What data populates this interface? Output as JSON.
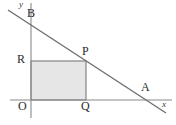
{
  "figure": {
    "background_color": "#ffffff",
    "line_color": "#6f6f6f",
    "axis_color": "#8a8a8a",
    "rect_fill_color": "#e6e6e6",
    "rect_stroke_color": "#7a7a7a",
    "label_color": "#2a2a2a"
  },
  "axes": {
    "x_axis": {
      "name": "x-axis",
      "label": "x",
      "start_px": [
        10,
        100
      ],
      "end_px": [
        172,
        100
      ]
    },
    "y_axis": {
      "name": "y-axis",
      "label": "y",
      "start_px": [
        31,
        118
      ],
      "end_px": [
        31,
        3
      ]
    },
    "origin_label": "O",
    "origin_px": [
      31,
      100
    ]
  },
  "line": {
    "name": "line-AB",
    "description": "straight line descending from upper-left through B and P to A on the x-axis",
    "start_px": [
      8,
      10
    ],
    "end_px": [
      166,
      113
    ],
    "passes_through": [
      "B",
      "P",
      "A"
    ]
  },
  "points": [
    {
      "id": "B",
      "label": "B",
      "px": [
        31,
        25
      ],
      "desc": "y-intercept of the line"
    },
    {
      "id": "R",
      "label": "R",
      "px": [
        31,
        61
      ],
      "desc": "point on y-axis, top-left corner of rectangle"
    },
    {
      "id": "P",
      "label": "P",
      "px": [
        86,
        61
      ],
      "desc": "point on the line, top-right corner of rectangle"
    },
    {
      "id": "Q",
      "label": "Q",
      "px": [
        86,
        100
      ],
      "desc": "point on x-axis, bottom-right corner of rectangle"
    },
    {
      "id": "O",
      "label": "O",
      "px": [
        31,
        100
      ],
      "desc": "origin, bottom-left corner of rectangle"
    },
    {
      "id": "A",
      "label": "A",
      "px": [
        148,
        100
      ],
      "desc": "x-intercept of the line"
    }
  ],
  "rectangle": {
    "name": "shaded-rectangle-OQPR",
    "vertices": [
      "O",
      "Q",
      "P",
      "R"
    ],
    "x_px": 31,
    "y_px": 61,
    "width_px": 55,
    "height_px": 39
  }
}
